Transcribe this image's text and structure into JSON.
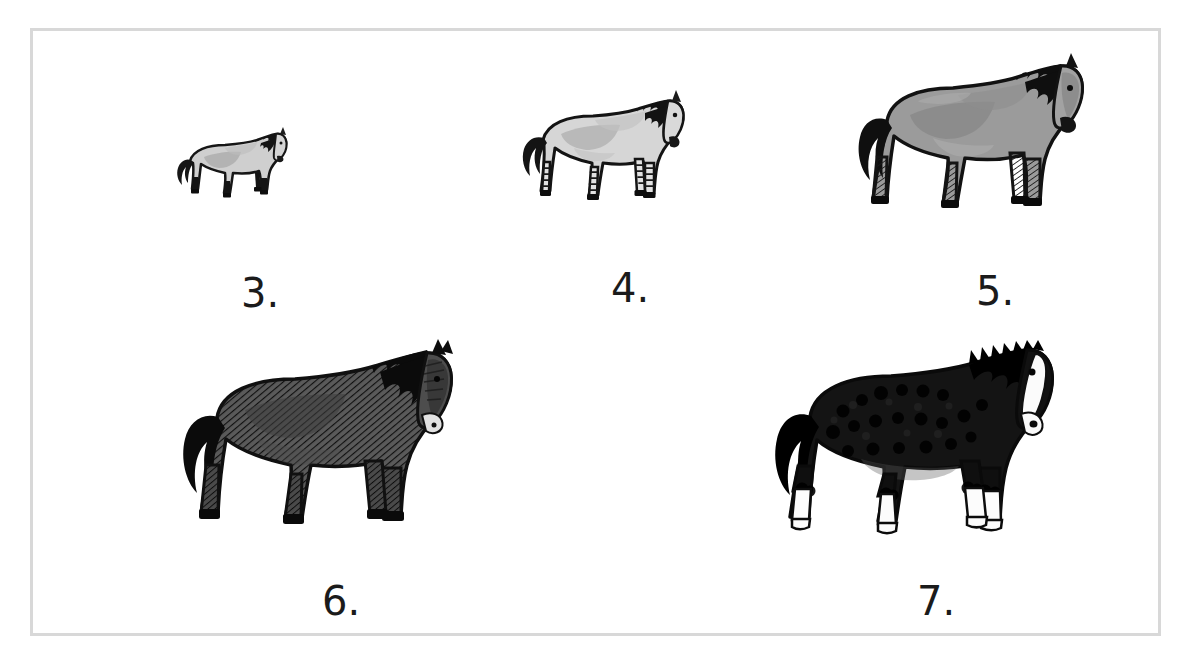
{
  "page": {
    "background_color": "#ffffff",
    "frame_border_color": "#d8d8d8",
    "ink_color": "#1b1b1b"
  },
  "figures": [
    {
      "id": "horse-3",
      "caption": "3.",
      "subject": "horse",
      "size_rank": 1,
      "relative_scale": 0.3,
      "coat_description": "light gray pony with dark mane, dark legs and hooves",
      "body_color": "#cfcfcf",
      "shading_color": "#9a9a9a",
      "dark_color": "#141414",
      "outline_color": "#161616",
      "has_white_socks": false,
      "has_white_blaze": false,
      "leg_pattern": "solid-dark",
      "position": {
        "x": 170,
        "y": 122
      },
      "art_size": {
        "w": 135,
        "h": 90
      },
      "caption_position": {
        "x": 208,
        "y": 242
      }
    },
    {
      "id": "horse-4",
      "caption": "4.",
      "subject": "horse",
      "size_rank": 2,
      "relative_scale": 0.52,
      "coat_description": "pale dun horse with dark mane and tail, striped legs",
      "body_color": "#d6d6d6",
      "shading_color": "#a4a4a4",
      "dark_color": "#121212",
      "outline_color": "#141414",
      "has_white_socks": false,
      "has_white_blaze": false,
      "leg_pattern": "striped",
      "position": {
        "x": 517,
        "y": 85
      },
      "art_size": {
        "w": 185,
        "h": 133
      },
      "caption_position": {
        "x": 578,
        "y": 242
      }
    },
    {
      "id": "horse-5",
      "caption": "5.",
      "subject": "horse",
      "size_rank": 3,
      "relative_scale": 0.72,
      "coat_description": "medium gray horse with black mane and tail, hatched dark legs",
      "body_color": "#9b9b9b",
      "shading_color": "#767676",
      "dark_color": "#0f0f0f",
      "outline_color": "#121212",
      "has_white_socks": false,
      "has_white_blaze": false,
      "leg_pattern": "hatched-dark",
      "position": {
        "x": 855,
        "y": 50
      },
      "art_size": {
        "w": 235,
        "h": 175
      },
      "caption_position": {
        "x": 943,
        "y": 246
      }
    },
    {
      "id": "horse-6",
      "caption": "6.",
      "subject": "horse",
      "size_rank": 4,
      "relative_scale": 0.9,
      "coat_description": "dark gray hatched horse with black mane and tail",
      "body_color": "#585858",
      "shading_color": "#3a3a3a",
      "dark_color": "#0d0d0d",
      "outline_color": "#101010",
      "has_white_socks": false,
      "has_white_blaze": false,
      "leg_pattern": "hatched-dark",
      "position": {
        "x": 178,
        "y": 340
      },
      "art_size": {
        "w": 285,
        "h": 200
      },
      "caption_position": {
        "x": 289,
        "y": 562
      }
    },
    {
      "id": "horse-7",
      "caption": "7.",
      "subject": "horse",
      "size_rank": 5,
      "relative_scale": 1.0,
      "coat_description": "black draft horse with white socks, white blaze and shaggy feathering",
      "body_color": "#151515",
      "shading_color": "#000000",
      "dark_color": "#000000",
      "outline_color": "#0a0a0a",
      "has_white_socks": true,
      "has_white_blaze": true,
      "leg_pattern": "white-socks",
      "position": {
        "x": 770,
        "y": 338
      },
      "art_size": {
        "w": 290,
        "h": 205
      },
      "caption_position": {
        "x": 884,
        "y": 560
      }
    }
  ]
}
